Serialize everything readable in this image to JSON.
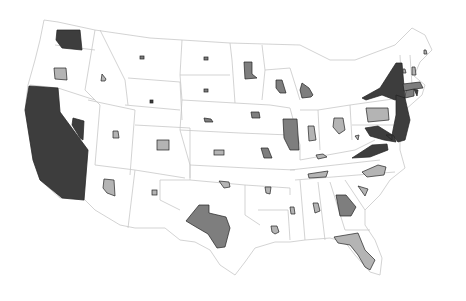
{
  "map": {
    "title": "United States cartogram",
    "colors": {
      "dark": "#3d3d3d",
      "medium": "#7e7e7e",
      "light": "#b4b4b4",
      "border": "#c8c8c8",
      "background": "#ffffff"
    },
    "states": [
      {
        "id": "WA",
        "shade": "dark",
        "shape": "poly",
        "pts": "57,30 80,30 82,50 62,48 56,40"
      },
      {
        "id": "OR",
        "shade": "light",
        "shape": "poly",
        "pts": "54,68 66,68 67,80 55,79"
      },
      {
        "id": "CA",
        "shade": "dark",
        "shape": "poly",
        "pts": "29,86 58,88 60,112 88,150 84,200 62,198 40,180 33,160 25,110"
      },
      {
        "id": "NV",
        "shade": "dark",
        "shape": "poly",
        "pts": "73,118 84,121 83,140 80,138 72,125"
      },
      {
        "id": "ID",
        "shade": "light",
        "shape": "poly",
        "pts": "102,74 106,79 105,81 101,81"
      },
      {
        "id": "MT",
        "shade": "medium",
        "shape": "rect",
        "x": 140,
        "y": 56,
        "w": 4,
        "h": 3
      },
      {
        "id": "WY",
        "shade": "dark",
        "shape": "rect",
        "x": 150,
        "y": 100,
        "w": 3,
        "h": 3
      },
      {
        "id": "UT",
        "shade": "light",
        "shape": "poly",
        "pts": "113,131 118,131 119,138 113,138"
      },
      {
        "id": "CO",
        "shade": "light",
        "shape": "rect",
        "x": 157,
        "y": 140,
        "w": 12,
        "h": 10
      },
      {
        "id": "AZ",
        "shade": "light",
        "shape": "poly",
        "pts": "104,179 114,180 115,196 107,193 103,188"
      },
      {
        "id": "NM",
        "shade": "light",
        "shape": "rect",
        "x": 152,
        "y": 190,
        "w": 5,
        "h": 5
      },
      {
        "id": "ND",
        "shade": "medium",
        "shape": "rect",
        "x": 204,
        "y": 57,
        "w": 4,
        "h": 3
      },
      {
        "id": "SD",
        "shade": "medium",
        "shape": "rect",
        "x": 204,
        "y": 89,
        "w": 4,
        "h": 3
      },
      {
        "id": "NE",
        "shade": "medium",
        "shape": "poly",
        "pts": "204,118 211,119 213,122 205,122"
      },
      {
        "id": "KS",
        "shade": "light",
        "shape": "rect",
        "x": 214,
        "y": 150,
        "w": 10,
        "h": 5
      },
      {
        "id": "OK",
        "shade": "light",
        "shape": "poly",
        "pts": "219,181 229,182 230,187 224,188"
      },
      {
        "id": "TX",
        "shade": "medium",
        "shape": "poly",
        "pts": "199,205 209,205 209,213 226,217 230,228 225,247 217,248 208,234 196,227 186,221"
      },
      {
        "id": "MN",
        "shade": "medium",
        "shape": "poly",
        "pts": "244,62 252,62 252,74 257,78 245,79"
      },
      {
        "id": "IA",
        "shade": "medium",
        "shape": "poly",
        "pts": "251,112 259,112 260,118 252,118"
      },
      {
        "id": "MO",
        "shade": "medium",
        "shape": "poly",
        "pts": "261,148 268,148 272,158 264,158"
      },
      {
        "id": "AR",
        "shade": "light",
        "shape": "poly",
        "pts": "265,187 271,187 270,194 266,193"
      },
      {
        "id": "LA",
        "shade": "light",
        "shape": "poly",
        "pts": "271,226 277,226 279,232 275,234 272,232"
      },
      {
        "id": "WI",
        "shade": "medium",
        "shape": "poly",
        "pts": "276,80 282,80 286,93 280,93 276,88"
      },
      {
        "id": "MI",
        "shade": "medium",
        "shape": "poly",
        "pts": "302,83 309,88 313,95 311,97 302,98 300,90"
      },
      {
        "id": "IL",
        "shade": "medium",
        "shape": "poly",
        "pts": "283,119 297,119 299,150 290,150 284,138"
      },
      {
        "id": "IN",
        "shade": "light",
        "shape": "poly",
        "pts": "308,126 314,126 316,140 309,141"
      },
      {
        "id": "OH",
        "shade": "light",
        "shape": "poly",
        "pts": "334,118 343,118 345,130 339,134 333,127"
      },
      {
        "id": "KY",
        "shade": "light",
        "shape": "poly",
        "pts": "316,155 323,154 327,157 318,159"
      },
      {
        "id": "TN",
        "shade": "light",
        "shape": "poly",
        "pts": "308,174 328,171 326,177 309,178"
      },
      {
        "id": "MS",
        "shade": "light",
        "shape": "poly",
        "pts": "290,207 294,207 295,214 291,214"
      },
      {
        "id": "AL",
        "shade": "light",
        "shape": "poly",
        "pts": "313,203 318,203 320,211 315,213"
      },
      {
        "id": "GA",
        "shade": "medium",
        "shape": "poly",
        "pts": "336,195 346,195 356,207 351,216 340,216"
      },
      {
        "id": "FL",
        "shade": "light",
        "shape": "poly",
        "pts": "334,237 358,233 365,250 375,260 370,270 365,267 358,255 350,245 338,243"
      },
      {
        "id": "SC",
        "shade": "light",
        "shape": "poly",
        "pts": "358,186 368,189 365,196"
      },
      {
        "id": "NC",
        "shade": "light",
        "shape": "poly",
        "pts": "362,172 378,165 386,167 384,175 367,177"
      },
      {
        "id": "VA",
        "shade": "dark",
        "shape": "poly",
        "pts": "352,158 372,145 387,144 388,150 370,157"
      },
      {
        "id": "WV",
        "shade": "light",
        "shape": "poly",
        "pts": "355,136 359,135 358,140"
      },
      {
        "id": "PA",
        "shade": "light",
        "shape": "poly",
        "pts": "366,108 388,108 389,120 368,122"
      },
      {
        "id": "NY",
        "shade": "dark",
        "shape": "poly",
        "pts": "362,98 380,88 396,63 402,63 405,98 395,100 382,95 366,100"
      },
      {
        "id": "NJ",
        "shade": "dark",
        "shape": "poly",
        "pts": "396,95 405,98 410,120 405,140 398,142 392,135 396,115"
      },
      {
        "id": "MD",
        "shade": "dark",
        "shape": "poly",
        "pts": "365,128 378,126 394,136 396,142 384,140 370,136"
      },
      {
        "id": "DE",
        "shade": "dark",
        "shape": "poly",
        "pts": "386,135 392,135 392,140"
      },
      {
        "id": "CT",
        "shade": "medium",
        "shape": "poly",
        "pts": "406,90 414,89 414,96 405,98"
      },
      {
        "id": "RI",
        "shade": "dark",
        "shape": "poly",
        "pts": "414,89 418,90 417,96"
      },
      {
        "id": "MA",
        "shade": "medium",
        "shape": "poly",
        "pts": "403,84 420,82 423,88 414,89 404,91"
      },
      {
        "id": "VT",
        "shade": "light",
        "shape": "poly",
        "pts": "403,69 405,69 406,73 403,73"
      },
      {
        "id": "NH",
        "shade": "light",
        "shape": "poly",
        "pts": "412,67 415,67 416,75 412,75"
      },
      {
        "id": "ME",
        "shade": "light",
        "shape": "poly",
        "pts": "424,50 426,50 427,54 424,54"
      }
    ]
  }
}
